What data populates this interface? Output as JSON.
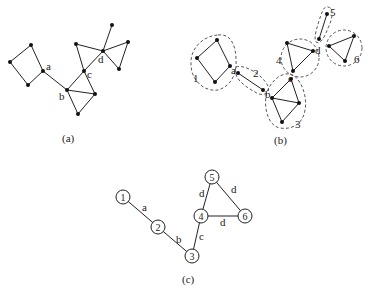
{
  "figure": {
    "panels": [
      {
        "id": "a",
        "caption": "(a)",
        "vertex_labels": {
          "a": "a",
          "b": "b",
          "c": "c",
          "d": "d"
        }
      },
      {
        "id": "b",
        "caption": "(b)",
        "vertex_labels": {
          "a": "a",
          "b": "b",
          "c": "c",
          "d": "d"
        },
        "block_labels": [
          "1",
          "2",
          "3",
          "4",
          "5",
          "6"
        ]
      },
      {
        "id": "c",
        "caption": "(c)",
        "nodes": [
          "1",
          "2",
          "3",
          "4",
          "5",
          "6"
        ],
        "edges": [
          {
            "from": "1",
            "to": "2",
            "label": "a"
          },
          {
            "from": "2",
            "to": "3",
            "label": "b"
          },
          {
            "from": "3",
            "to": "4",
            "label": "c"
          },
          {
            "from": "4",
            "to": "5",
            "label": "d"
          },
          {
            "from": "5",
            "to": "6",
            "label": "d"
          },
          {
            "from": "4",
            "to": "6",
            "label": "d"
          }
        ]
      }
    ],
    "colors": {
      "ink": "#222222",
      "background": "#ffffff"
    }
  }
}
